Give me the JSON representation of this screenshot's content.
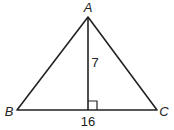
{
  "diagram": {
    "type": "triangle",
    "vertices": {
      "A": {
        "label": "A",
        "x": 88,
        "y": 17
      },
      "B": {
        "label": "B",
        "x": 17,
        "y": 110
      },
      "C": {
        "label": "C",
        "x": 157,
        "y": 110
      }
    },
    "altitude": {
      "from": "A",
      "foot_x": 88,
      "foot_y": 110,
      "length_label": "7"
    },
    "base": {
      "from": "B",
      "to": "C",
      "length_label": "16"
    },
    "right_angle_marker": true,
    "stroke_color": "#222222"
  }
}
